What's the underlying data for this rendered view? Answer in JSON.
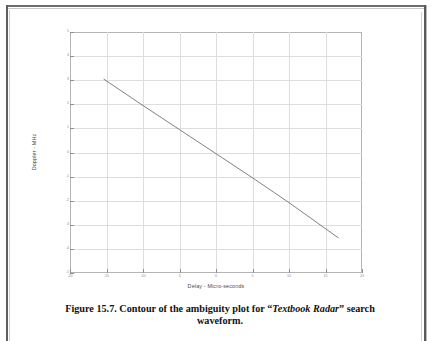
{
  "page": {
    "kind": "scanned-book-page",
    "background_color": "#ffffff",
    "border_color": "#5f5f5f"
  },
  "caption": {
    "prefix": "Figure 15.7. Contour of the ambiguity plot for ",
    "quote_open": "“",
    "emphasis": "Textbook Radar",
    "quote_close": "”",
    "suffix": " search waveform."
  },
  "figure": {
    "axes_line_color": "#b4b4b4",
    "grid_color": "#dedede",
    "tick_color": "#8e8e8e",
    "contour_color": "#4a4a4a"
  },
  "chart_data": {
    "type": "line",
    "title": "",
    "subtitle": "",
    "xlabel": "Delay - Micro-seconds",
    "ylabel": "Doppler - MHz",
    "xlim": [
      -20,
      20
    ],
    "ylim": [
      -5,
      5
    ],
    "xticks": [
      -20,
      -15,
      -10,
      -5,
      0,
      5,
      10,
      15,
      20
    ],
    "xticklabels": [
      "-20",
      "-15",
      "-10",
      "-5",
      "0",
      "5",
      "10",
      "15",
      "20"
    ],
    "yticks": [
      -5,
      -4,
      -3,
      -2,
      -1,
      0,
      1,
      2,
      3,
      4,
      5
    ],
    "yticklabels": [
      "-5",
      "-4",
      "-3",
      "-2",
      "-1",
      "0",
      "1",
      "2",
      "3",
      "4",
      "5"
    ],
    "grid": true,
    "legend": null,
    "legend_position": "none",
    "annotations": [],
    "series": [
      {
        "name": "ambiguity ridge contour (outer)",
        "comment": "Closed contour: narrow tilted ellipse, semi-major axis along the delay-doppler coupling line.",
        "center": [
          0.6,
          -0.25
        ],
        "length": 36.5,
        "width": 1.05,
        "angle_deg": -9.6,
        "endpoint_upper_left": [
          -15.4,
          3.05
        ],
        "endpoint_lower_right": [
          16.8,
          -3.55
        ]
      },
      {
        "name": "ambiguity ridge contour (inner 1)",
        "center": [
          0.6,
          -0.25
        ],
        "length": 35.2,
        "width": 0.62,
        "angle_deg": -9.6
      },
      {
        "name": "ambiguity ridge contour (inner 2)",
        "center": [
          0.6,
          -0.25
        ],
        "length": 34.2,
        "width": 0.34,
        "angle_deg": -9.6
      },
      {
        "name": "ambiguity ridge centerline",
        "x": [
          -15.4,
          -10.0,
          -5.0,
          0.0,
          5.0,
          10.0,
          16.8
        ],
        "y": [
          3.05,
          1.95,
          0.95,
          -0.05,
          -1.05,
          -2.08,
          -3.55
        ]
      }
    ]
  }
}
